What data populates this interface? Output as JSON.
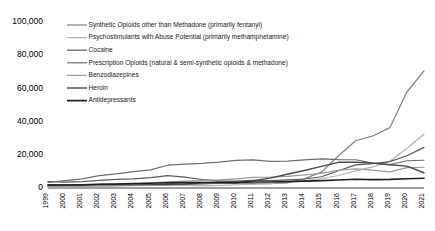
{
  "chart_data": {
    "type": "line",
    "title": "",
    "subtitle": "",
    "xlabel": "",
    "ylabel": "",
    "grid": false,
    "legend_position": "inside-top-left",
    "ylim": [
      0,
      100000
    ],
    "yticks": [
      0,
      20000,
      40000,
      60000,
      80000,
      100000
    ],
    "ytick_labels": [
      "0",
      "20,000",
      "40,000",
      "60,000",
      "80,000",
      "100,000"
    ],
    "x": [
      1999,
      2000,
      2001,
      2002,
      2003,
      2004,
      2005,
      2006,
      2007,
      2008,
      2009,
      2010,
      2011,
      2012,
      2013,
      2014,
      2015,
      2016,
      2017,
      2018,
      2019,
      2020,
      2021
    ],
    "xtick_labels": [
      "1999",
      "2000",
      "2001",
      "2002",
      "2003",
      "2004",
      "2005",
      "2006",
      "2007",
      "2008",
      "2009",
      "2010",
      "2011",
      "2012",
      "2013",
      "2014",
      "2015",
      "2016",
      "2017",
      "2018",
      "2019",
      "2020",
      "2021"
    ],
    "series": [
      {
        "name": "Synthetic Opioids other than Methadone (primarily fentanyl)",
        "color": "#808080",
        "width": 1.2,
        "values": [
          730,
          782,
          957,
          1295,
          1400,
          1664,
          1742,
          2707,
          2213,
          2306,
          2946,
          3007,
          2666,
          2628,
          3105,
          5544,
          9580,
          19413,
          28466,
          31335,
          36359,
          57834,
          70601
        ]
      },
      {
        "name": "Psychostimulants with Abuse Potential (primarily methamphetamine)",
        "color": "#b3b3b3",
        "width": 1.2,
        "values": [
          547,
          573,
          613,
          930,
          1194,
          1379,
          1608,
          1759,
          1518,
          1301,
          1632,
          1854,
          2266,
          2635,
          3627,
          4298,
          5716,
          7542,
          10333,
          12676,
          16167,
          23837,
          32537
        ]
      },
      {
        "name": "Cocaine",
        "color": "#5a5a5a",
        "width": 1.2,
        "values": [
          3822,
          3544,
          3833,
          4599,
          5196,
          5443,
          6208,
          7448,
          6512,
          5129,
          4350,
          4183,
          4681,
          4404,
          4944,
          5415,
          6784,
          10375,
          13942,
          14666,
          15883,
          19447,
          24486
        ]
      },
      {
        "name": "Prescription Opioids (natural & semi-synthetic opioids & methadone)",
        "color": "#6e6e6e",
        "width": 1.2,
        "values": [
          3442,
          4400,
          5528,
          7456,
          8517,
          9857,
          10928,
          13723,
          14408,
          14800,
          15597,
          16651,
          16917,
          16007,
          16235,
          16941,
          17536,
          17087,
          17029,
          14975,
          14139,
          16416,
          16706
        ]
      },
      {
        "name": "Benzodiazepines",
        "color": "#9a9a9a",
        "width": 1.2,
        "values": [
          1036,
          1121,
          1399,
          1823,
          2131,
          2525,
          3094,
          3718,
          4097,
          4388,
          4855,
          5552,
          6433,
          6524,
          6973,
          7945,
          8791,
          10684,
          11537,
          10724,
          9711,
          12290,
          12499
        ]
      },
      {
        "name": "Heroin",
        "color": "#4a4a4a",
        "width": 1.4,
        "values": [
          1960,
          1842,
          1779,
          2089,
          2080,
          1878,
          2009,
          2088,
          2399,
          3041,
          3278,
          3036,
          4397,
          5925,
          8257,
          10574,
          12989,
          15469,
          15482,
          14996,
          14019,
          13165,
          9173
        ]
      },
      {
        "name": "Antidepressants",
        "color": "#1f1f1f",
        "width": 1.6,
        "values": [
          1749,
          1812,
          1987,
          2296,
          2447,
          2674,
          2892,
          3157,
          3242,
          3301,
          3392,
          3410,
          3574,
          3570,
          3815,
          4114,
          4423,
          4860,
          5269,
          5064,
          5175,
          5597,
          5901
        ]
      }
    ]
  },
  "legend": {
    "items": [
      {
        "label": "Synthetic Opioids other than Methadone (primarily fentanyl)",
        "color": "#808080"
      },
      {
        "label": "Psychostimulants with Abuse Potential (primarily methamphetamine)",
        "color": "#b3b3b3"
      },
      {
        "label": "Cocaine",
        "color": "#5a5a5a"
      },
      {
        "label": "Prescription Opioids (natural & semi-synthetic opioids & methadone)",
        "color": "#6e6e6e"
      },
      {
        "label": "Benzodiazepines",
        "color": "#9a9a9a"
      },
      {
        "label": "Heroin",
        "color": "#4a4a4a"
      },
      {
        "label": "Antidepressants",
        "color": "#1f1f1f"
      }
    ]
  }
}
